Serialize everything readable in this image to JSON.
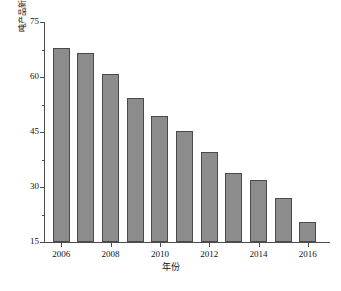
{
  "chart_data": {
    "type": "bar",
    "title": "",
    "subtitle": "",
    "xlabel": "年份",
    "ylabel": "吨产品新鲜水耗量/m³",
    "ylabel_main": "吨产品新鲜水耗量/m",
    "ylabel_sup": "3",
    "categories": [
      "2006",
      "2007",
      "2008",
      "2009",
      "2010",
      "2011",
      "2012",
      "2013",
      "2014",
      "2015",
      "2016"
    ],
    "values": [
      68,
      66.5,
      60.8,
      54.2,
      49.4,
      45.4,
      39.6,
      33.8,
      31.8,
      27,
      20.5
    ],
    "series": [
      {
        "name": "吨产品新鲜水耗量",
        "values": [
          68,
          66.5,
          60.8,
          54.2,
          49.4,
          45.4,
          39.6,
          33.8,
          31.8,
          27,
          20.5
        ]
      }
    ],
    "xlim": [
      2005.3,
      2016.9
    ],
    "ylim": [
      15,
      75
    ],
    "y_ticks": [
      15,
      30,
      45,
      60,
      75
    ],
    "y_tick_labels": [
      "15",
      "30",
      "45",
      "60",
      "75"
    ],
    "y_minor_ticks": [
      22.5,
      37.5,
      52.5,
      67.5
    ],
    "x_ticks": [
      2006,
      2008,
      2010,
      2012,
      2014,
      2016
    ],
    "x_tick_labels": [
      "2006",
      "2008",
      "2010",
      "2012",
      "2014",
      "2016"
    ],
    "grid": false,
    "legend": false,
    "legend_position": "none",
    "colors": {
      "bar_fill": "#8c8c8c",
      "bar_edge": "#4a4a4a",
      "axis": "#4d4d4d",
      "text": "#111111",
      "background": "#ffffff"
    }
  }
}
